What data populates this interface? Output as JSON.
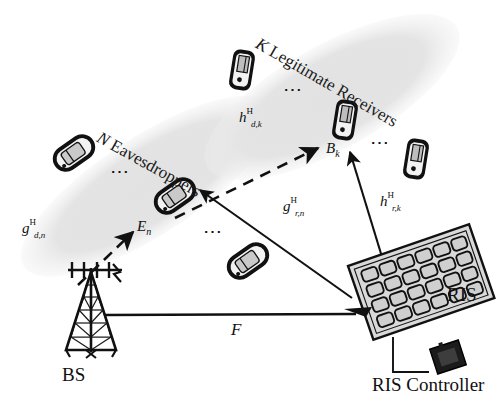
{
  "figure": {
    "type": "system-model-diagram",
    "domain": "wireless-communications",
    "background": "#ffffff"
  },
  "zones": [
    {
      "id": "eavesdroppers",
      "label_italic": "N",
      "label_rest": " Eavesdroppers",
      "full_label": "N Eavesdroppers",
      "fill": "#e4e4e4",
      "cx": 148,
      "cy": 186,
      "rx": 148,
      "ry": 49,
      "rotation": -33,
      "label_x": 103,
      "label_y": 128,
      "label_rotation": 29
    },
    {
      "id": "legitimate-receivers",
      "label_italic": "K",
      "label_rest": " Legitimate Receivers",
      "full_label": "K Legitimate Receivers",
      "fill": "#e4e4e4",
      "cx": 332,
      "cy": 97,
      "rx": 143,
      "ry": 52,
      "rotation": -29,
      "label_x": 262,
      "label_y": 34,
      "label_rotation": 30
    }
  ],
  "phones": [
    {
      "name": "eve-phone-1",
      "x": 55,
      "y": 140,
      "w": 40,
      "h": 26,
      "rot": -35,
      "style": "tilted"
    },
    {
      "name": "eve-phone-selected",
      "x": 155,
      "y": 183,
      "w": 40,
      "h": 26,
      "rot": -35,
      "style": "tilted"
    },
    {
      "name": "eve-phone-3",
      "x": 228,
      "y": 247,
      "w": 40,
      "h": 26,
      "rot": -35,
      "style": "tilted"
    },
    {
      "name": "receiver-phone-1",
      "x": 231,
      "y": 52,
      "w": 22,
      "h": 38,
      "rot": 10,
      "style": "upright"
    },
    {
      "name": "receiver-phone-selected",
      "x": 334,
      "y": 101,
      "w": 22,
      "h": 38,
      "rot": 10,
      "style": "upright"
    },
    {
      "name": "receiver-phone-3",
      "x": 405,
      "y": 140,
      "w": 22,
      "h": 38,
      "rot": 10,
      "style": "upright"
    }
  ],
  "ellipsis": [
    {
      "name": "eve-ellipsis-1",
      "x": 110,
      "y": 168,
      "rot": 0
    },
    {
      "name": "eve-ellipsis-2",
      "x": 203,
      "y": 228,
      "rot": 0
    },
    {
      "name": "receiver-ellipsis-1",
      "x": 283,
      "y": 86,
      "rot": 0
    },
    {
      "name": "receiver-ellipsis-2",
      "x": 370,
      "y": 139,
      "rot": 0
    }
  ],
  "nodes": {
    "base_station": {
      "label": "BS",
      "label_x": 62,
      "label_y": 372,
      "icon": "tower-antenna-icon"
    },
    "ris": {
      "label": "RIS",
      "label_x": 447,
      "label_y": 294,
      "icon": "ris-panel-icon",
      "rows": 4,
      "cols": 6
    },
    "ris_controller": {
      "label": "RIS Controller",
      "label_x": 372,
      "label_y": 383,
      "icon": "controller-box-icon"
    },
    "eavesdropper": {
      "label_base": "E",
      "label_sub": "n",
      "label_x": 137,
      "label_y": 226
    },
    "receiver": {
      "label_base": "B",
      "label_sub": "k",
      "label_x": 328,
      "label_y": 148
    }
  },
  "channels": [
    {
      "id": "g-d-n",
      "base": "g",
      "sup": "H",
      "sub": "d,n",
      "label_x": 22,
      "label_y": 227,
      "style": "dashed",
      "from": "BS",
      "to": "E_n",
      "description": "BS to eavesdropper direct channel"
    },
    {
      "id": "h-d-k",
      "base": "h",
      "sup": "H",
      "sub": "d,k",
      "label_x": 239,
      "label_y": 116,
      "style": "dashed",
      "from": "BS",
      "to": "B_k",
      "description": "BS to legitimate receiver direct channel"
    },
    {
      "id": "g-r-n",
      "base": "g",
      "sup": "H",
      "sub": "r,n",
      "label_x": 283,
      "label_y": 205,
      "style": "solid",
      "from": "RIS",
      "to": "E_n",
      "description": "RIS to eavesdropper reflected channel"
    },
    {
      "id": "h-r-k",
      "base": "h",
      "sup": "H",
      "sub": "r,k",
      "label_x": 380,
      "label_y": 200,
      "style": "solid",
      "from": "RIS",
      "to": "B_k",
      "description": "RIS to legitimate receiver reflected channel"
    },
    {
      "id": "F",
      "base": "F",
      "sup": "",
      "sub": "",
      "label_x": 231,
      "label_y": 328,
      "style": "solid",
      "from": "BS",
      "to": "RIS",
      "description": "BS to RIS channel matrix"
    }
  ],
  "links": {
    "bs_to_ris": {
      "x1": 104,
      "y1": 315,
      "x2": 355,
      "y2": 315
    },
    "ris_to_controller": {
      "x1": 393,
      "y1": 337,
      "x2": 393,
      "y2": 372,
      "x3": 432,
      "y3": 372
    }
  }
}
